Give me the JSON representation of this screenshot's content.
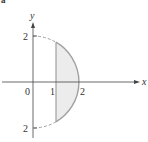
{
  "figure": {
    "corner_label": "a",
    "axes": {
      "x_label": "x",
      "y_label": "y"
    },
    "tick_labels": {
      "origin": "0",
      "x1": "1",
      "x2": "2",
      "y_top": "2",
      "y_bottom": "2"
    },
    "region": {
      "description": "Region between x = 1 and circle x^2 + y^2 = 4 (right half), shaded",
      "fill_color": "#ececec",
      "curve_color": "#a0a0a0",
      "dashed_curve_color": "#a0a0a0"
    },
    "colors": {
      "axis": "#444444",
      "text": "#333333"
    }
  }
}
